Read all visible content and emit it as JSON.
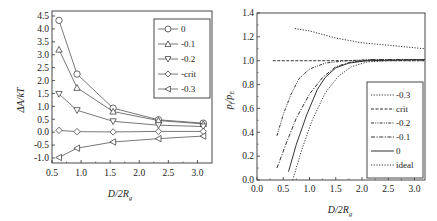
{
  "chart_data": [
    {
      "type": "line",
      "panel": "left",
      "xlabel": "D/2R_g",
      "ylabel": "ΔA/kT",
      "xlim": [
        0.5,
        3.25
      ],
      "ylim": [
        -1.25,
        4.5
      ],
      "xticks": [
        "0.5",
        "1.0",
        "1.5",
        "2.0",
        "2.5",
        "3.0"
      ],
      "yticks": [
        "-1.0",
        "-0.5",
        "0.0",
        "0.5",
        "1.0",
        "1.5",
        "2.0",
        "2.5",
        "3.0",
        "3.5",
        "4.0",
        "4.5"
      ],
      "grid": false,
      "legend_position": "upper right",
      "x": [
        0.62,
        0.93,
        1.55,
        2.33,
        3.1
      ],
      "series": [
        {
          "name": "0",
          "marker": "circle",
          "values": [
            4.33,
            2.25,
            0.93,
            0.48,
            0.35
          ]
        },
        {
          "name": "-0.1",
          "marker": "triangle-up",
          "values": [
            3.2,
            1.72,
            0.8,
            0.45,
            0.32
          ]
        },
        {
          "name": "-0.2",
          "marker": "triangle-down",
          "values": [
            1.48,
            0.85,
            0.42,
            0.27,
            0.22
          ]
        },
        {
          "name": "-crit",
          "marker": "diamond",
          "values": [
            0.07,
            0.02,
            0.01,
            0.03,
            0.03
          ]
        },
        {
          "name": "-0.3",
          "marker": "triangle-left",
          "values": [
            -0.98,
            -0.62,
            -0.38,
            -0.25,
            -0.15
          ]
        }
      ]
    },
    {
      "type": "line",
      "panel": "right",
      "xlabel": "D/2R_g",
      "ylabel": "p_f/p_E",
      "xlim": [
        0.0,
        3.2
      ],
      "ylim": [
        0.0,
        1.4
      ],
      "xticks": [
        "0.0",
        "0.5",
        "1.0",
        "1.5",
        "2.0",
        "2.5",
        "3.0"
      ],
      "yticks": [
        "0.0",
        "0.2",
        "0.4",
        "0.6",
        "0.8",
        "1.0",
        "1.2",
        "1.4"
      ],
      "grid": false,
      "legend_position": "lower right",
      "series": [
        {
          "name": "-0.3",
          "style": "dotted",
          "points": [
            [
              0.72,
              1.27
            ],
            [
              1.0,
              1.25
            ],
            [
              1.5,
              1.19
            ],
            [
              2.0,
              1.15
            ],
            [
              2.5,
              1.13
            ],
            [
              3.2,
              1.1
            ]
          ]
        },
        {
          "name": "crit",
          "style": "dashed",
          "points": [
            [
              0.3,
              1.0
            ],
            [
              1.0,
              1.0
            ],
            [
              2.0,
              1.0
            ],
            [
              3.2,
              1.0
            ]
          ]
        },
        {
          "name": "-0.2",
          "style": "dash-dot-dot",
          "points": [
            [
              0.38,
              0.37
            ],
            [
              0.5,
              0.55
            ],
            [
              0.65,
              0.72
            ],
            [
              0.8,
              0.85
            ],
            [
              1.0,
              0.93
            ],
            [
              1.3,
              0.98
            ],
            [
              1.7,
              1.0
            ],
            [
              2.2,
              1.01
            ],
            [
              3.2,
              1.01
            ]
          ]
        },
        {
          "name": "-0.1",
          "style": "dash-dot",
          "points": [
            [
              0.38,
              0.1
            ],
            [
              0.55,
              0.3
            ],
            [
              0.75,
              0.52
            ],
            [
              1.0,
              0.72
            ],
            [
              1.25,
              0.86
            ],
            [
              1.5,
              0.95
            ],
            [
              1.8,
              0.99
            ],
            [
              2.2,
              1.01
            ],
            [
              3.2,
              1.01
            ]
          ]
        },
        {
          "name": "0",
          "style": "solid",
          "points": [
            [
              0.6,
              0.07
            ],
            [
              0.75,
              0.3
            ],
            [
              0.95,
              0.55
            ],
            [
              1.15,
              0.76
            ],
            [
              1.3,
              0.86
            ],
            [
              1.5,
              0.94
            ],
            [
              1.75,
              0.98
            ],
            [
              2.1,
              1.0
            ],
            [
              3.2,
              1.01
            ]
          ]
        },
        {
          "name": "ideal",
          "style": "dotted",
          "points": [
            [
              0.68,
              0.0
            ],
            [
              0.85,
              0.25
            ],
            [
              1.05,
              0.5
            ],
            [
              1.3,
              0.73
            ],
            [
              1.55,
              0.87
            ],
            [
              1.8,
              0.95
            ],
            [
              2.1,
              0.99
            ],
            [
              2.5,
              1.0
            ],
            [
              3.2,
              1.0
            ]
          ]
        }
      ]
    }
  ],
  "left_panel": {
    "ylabel": "ΔA/kT",
    "xlabel_main": "D/2R",
    "xlabel_sub": "g",
    "legend": [
      "0",
      "-0.1",
      "-0.2",
      "-crit",
      "-0.3"
    ]
  },
  "right_panel": {
    "ylabel_main": "p",
    "ylabel_sub1": "f",
    "ylabel_mid": "/p",
    "ylabel_sub2": "E",
    "xlabel_main": "D/2R",
    "xlabel_sub": "g",
    "legend": [
      "-0.3",
      "crit",
      "-0.2",
      "-0.1",
      "0",
      "ideal"
    ]
  }
}
